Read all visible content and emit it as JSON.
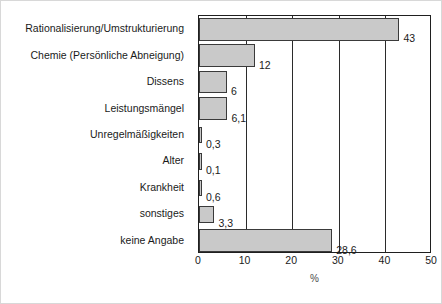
{
  "chart_data": {
    "type": "bar",
    "orientation": "horizontal",
    "title": "",
    "subtitle": "",
    "xlabel": "%",
    "ylabel": "",
    "xlim": [
      0,
      50
    ],
    "xticks": [
      0,
      10,
      20,
      30,
      40,
      50
    ],
    "xtick_labels": [
      "0",
      "10",
      "20",
      "30",
      "40",
      "50"
    ],
    "grid": true,
    "grid_axis": "x",
    "legend": false,
    "categories": [
      "Rationalisierung/Umstrukturierung",
      "Chemie (Persönliche Abneigung)",
      "Dissens",
      "Leistungsmängel",
      "Unregelmäßigkeiten",
      "Alter",
      "Krankheit",
      "sonstiges",
      "keine Angabe"
    ],
    "values": [
      43,
      12,
      6,
      6.1,
      0.3,
      0.1,
      0.6,
      3.3,
      28.6
    ],
    "value_labels": [
      "43",
      "12",
      "6",
      "6,1",
      "0,3",
      "0,1",
      "0,6",
      "3,3",
      "28,6"
    ],
    "bar_color": "#c9c9c9",
    "bar_edge_color": "#3a3a3a",
    "axis_color": "#1f1f1f",
    "text_color": "#1a1a1a"
  }
}
